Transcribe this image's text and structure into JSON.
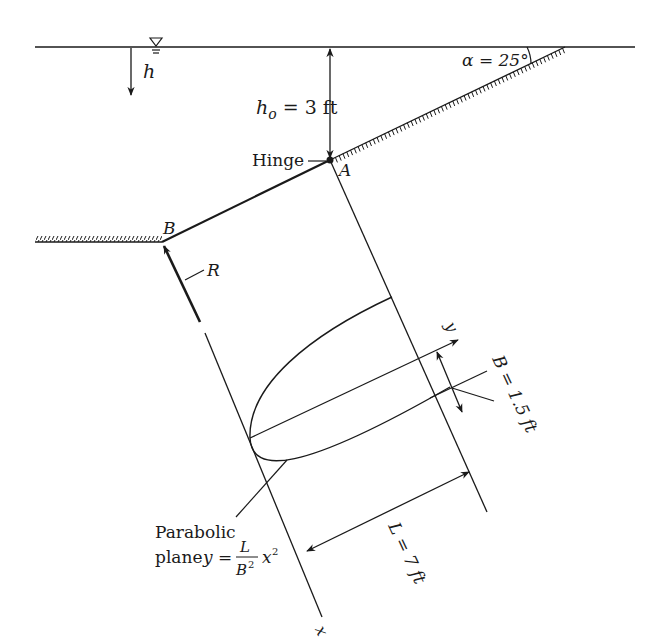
{
  "figure": {
    "type": "engineering-diagram"
  },
  "labels": {
    "h": "h",
    "alpha": "α = 25°",
    "ho_main": "h",
    "ho_sub": "o",
    "ho_rest": " = 3 ft",
    "hinge": "Hinge",
    "A": "A",
    "B": "B",
    "R": "R",
    "y_axis": "y",
    "x_axis": "x",
    "B_dim": "B = 1.5 ft",
    "L_dim": "L = 7 ft",
    "parabolic_line1": "Parabolic",
    "parabolic_line2": "plane",
    "eq_y": "y",
    "eq_equals": "=",
    "eq_num": "L",
    "eq_den": "B",
    "eq_den_exp": "2",
    "eq_x": "x",
    "eq_x_exp": "2"
  },
  "values": {
    "alpha_deg": 25,
    "ho_ft": 3,
    "B_ft": 1.5,
    "L_ft": 7
  },
  "colors": {
    "ink": "#1a1a1a",
    "background": "#ffffff"
  }
}
